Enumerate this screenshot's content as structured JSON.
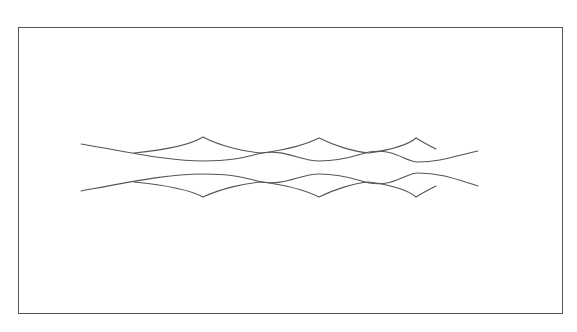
{
  "figure": {
    "type": "line-drawing",
    "frame": {
      "x": 18,
      "y": 27,
      "width": 545,
      "height": 287,
      "border_color": "#555555"
    },
    "stroke_color": "#555555",
    "axis_of_symmetry_y": 167,
    "top_pair": {
      "smooth_wave": {
        "name": "top-smooth-wave",
        "path": "M81,144 C140,154 170,161 203,161 C240,161 250,155 262,153 C285,149 300,161 319,161 C345,161 360,154 369,152 C395,148 405,162 418,162 C440,162 455,156 478,151"
      },
      "cusp_chain": {
        "name": "top-cusp-chain",
        "path": "M134,153 C165,150 190,145 203,137 C220,146 245,152 262,153 C285,150 305,145 319,138 C335,146 355,152 369,153 C390,150 408,145 416,138 C424,143 430,146 436,149",
        "cusps": [
          [
            203,
            137
          ],
          [
            319,
            138
          ],
          [
            416,
            138
          ]
        ]
      }
    },
    "bottom_pair": {
      "smooth_wave": {
        "name": "bottom-smooth-wave",
        "path": "M81,191 C140,180 170,174 203,174 C240,174 250,180 262,182 C285,186 300,174 319,174 C345,174 360,181 369,183 C395,187 405,173 418,173 C440,173 455,179 478,186"
      },
      "cusp_chain": {
        "name": "bottom-cusp-chain",
        "path": "M134,182 C165,185 190,190 203,197 C220,189 245,183 262,182 C285,185 305,190 319,197 C335,189 355,183 369,182 C390,185 408,190 416,197 C424,192 430,189 436,186",
        "cusps": [
          [
            203,
            197
          ],
          [
            319,
            197
          ],
          [
            416,
            197
          ]
        ]
      }
    },
    "intersections": [
      [
        134,
        153
      ],
      [
        262,
        153
      ],
      [
        369,
        153
      ],
      [
        134,
        182
      ],
      [
        262,
        182
      ],
      [
        369,
        182
      ]
    ]
  }
}
